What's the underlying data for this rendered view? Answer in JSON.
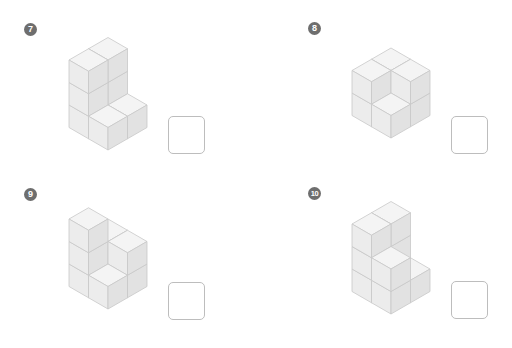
{
  "worksheet": {
    "task": "count-cubes",
    "colors": {
      "badge": "#6e6e6e",
      "cube_top": "#f4f4f4",
      "cube_left": "#ececec",
      "cube_right": "#e2e2e2",
      "edge": "#c8c8c8",
      "answer_border": "#bdbdbd"
    },
    "problems": [
      {
        "number": "7",
        "answer": ""
      },
      {
        "number": "8",
        "answer": ""
      },
      {
        "number": "9",
        "answer": ""
      },
      {
        "number": "10",
        "answer": ""
      }
    ]
  }
}
